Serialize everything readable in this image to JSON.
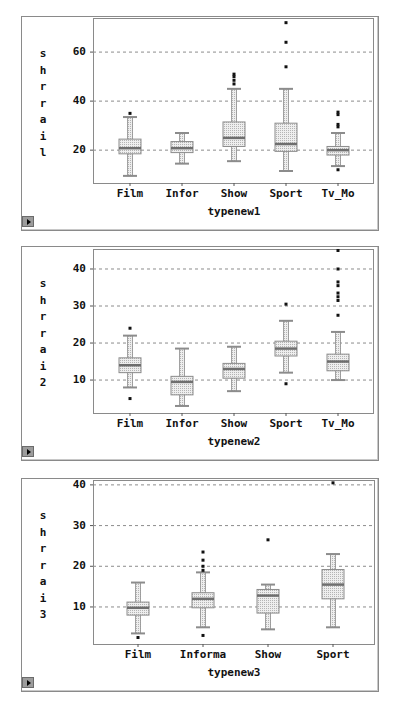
{
  "chart_data": [
    {
      "type": "box",
      "title": "",
      "xlabel": "typenew1",
      "ylabel": "shrrail",
      "ylabel_chars": [
        "s",
        "h",
        "r",
        "r",
        "a",
        "i",
        "l"
      ],
      "yticks": [
        20,
        40,
        60
      ],
      "ylim": [
        6.6,
        73.9
      ],
      "grid": "horizontal dashed",
      "categories": [
        "Film",
        "Infor",
        "Show",
        "Sport",
        "Tv_Mo"
      ],
      "boxes": [
        {
          "category": "Film",
          "whisker_low": 9.5,
          "q1": 18.5,
          "median": 20.8,
          "q3": 24.5,
          "whisker_high": 33.5,
          "outliers": [
            35
          ]
        },
        {
          "category": "Infor",
          "whisker_low": 14.5,
          "q1": 19.0,
          "median": 20.8,
          "q3": 23.5,
          "whisker_high": 27.0,
          "outliers": []
        },
        {
          "category": "Show",
          "whisker_low": 15.5,
          "q1": 21.5,
          "median": 25.0,
          "q3": 31.5,
          "whisker_high": 45.0,
          "outliers": [
            47,
            48.5,
            50,
            51
          ]
        },
        {
          "category": "Sport",
          "whisker_low": 11.5,
          "q1": 19.5,
          "median": 22.5,
          "q3": 31.0,
          "whisker_high": 45.0,
          "outliers": [
            54,
            64,
            72
          ]
        },
        {
          "category": "Tv_Mo",
          "whisker_low": 13.5,
          "q1": 18.0,
          "median": 20.0,
          "q3": 21.5,
          "whisker_high": 27.0,
          "outliers": [
            12,
            29.5,
            30.5,
            34.5,
            35.5
          ]
        }
      ]
    },
    {
      "type": "box",
      "title": "",
      "xlabel": "typenew2",
      "ylabel": "shrrai2",
      "ylabel_chars": [
        "s",
        "h",
        "r",
        "r",
        "a",
        "i",
        "2"
      ],
      "yticks": [
        10,
        20,
        30,
        40
      ],
      "ylim": [
        1.1,
        45.4
      ],
      "grid": "horizontal dashed",
      "categories": [
        "Film",
        "Infor",
        "Show",
        "Sport",
        "Tv_Mo"
      ],
      "boxes": [
        {
          "category": "Film",
          "whisker_low": 8.0,
          "q1": 12.0,
          "median": 14.0,
          "q3": 16.0,
          "whisker_high": 22.0,
          "outliers": [
            5,
            24
          ]
        },
        {
          "category": "Infor",
          "whisker_low": 3.0,
          "q1": 6.0,
          "median": 9.5,
          "q3": 11.0,
          "whisker_high": 18.5,
          "outliers": []
        },
        {
          "category": "Show",
          "whisker_low": 7.0,
          "q1": 10.5,
          "median": 13.0,
          "q3": 14.5,
          "whisker_high": 19.0,
          "outliers": []
        },
        {
          "category": "Sport",
          "whisker_low": 12.0,
          "q1": 16.5,
          "median": 18.5,
          "q3": 20.5,
          "whisker_high": 26.0,
          "outliers": [
            9,
            30.5
          ]
        },
        {
          "category": "Tv_Mo",
          "whisker_low": 10.0,
          "q1": 12.5,
          "median": 15.0,
          "q3": 17.0,
          "whisker_high": 23.0,
          "outliers": [
            27.5,
            31.5,
            32.5,
            33.5,
            35.5,
            36.5,
            40,
            45
          ]
        }
      ]
    },
    {
      "type": "box",
      "title": "",
      "xlabel": "typenew3",
      "ylabel": "shrrai3",
      "ylabel_chars": [
        "s",
        "h",
        "r",
        "r",
        "a",
        "i",
        "3"
      ],
      "yticks": [
        10,
        20,
        30,
        40
      ],
      "ylim": [
        0.9,
        41.2
      ],
      "grid": "horizontal dashed",
      "categories": [
        "Film",
        "Informa",
        "Show",
        "Sport"
      ],
      "boxes": [
        {
          "category": "Film",
          "whisker_low": 3.5,
          "q1": 8.0,
          "median": 9.8,
          "q3": 11.2,
          "whisker_high": 16.0,
          "outliers": [
            2.5
          ]
        },
        {
          "category": "Informa",
          "whisker_low": 5.0,
          "q1": 9.8,
          "median": 12.0,
          "q3": 13.5,
          "whisker_high": 18.5,
          "outliers": [
            3,
            19,
            20,
            21.5,
            23.5
          ]
        },
        {
          "category": "Show",
          "whisker_low": 4.5,
          "q1": 8.5,
          "median": 12.8,
          "q3": 14.3,
          "whisker_high": 15.5,
          "outliers": [
            26.5
          ]
        },
        {
          "category": "Sport",
          "whisker_low": 5.0,
          "q1": 12.0,
          "median": 15.5,
          "q3": 19.2,
          "whisker_high": 23.0,
          "outliers": [
            40.5
          ]
        }
      ]
    }
  ],
  "colors": {
    "box_fill": "#e6e6e6",
    "box_edge": "#8c8c8c",
    "median": "#6e6e6e",
    "outlier": "#111111",
    "grid": "#8c8c8c"
  }
}
